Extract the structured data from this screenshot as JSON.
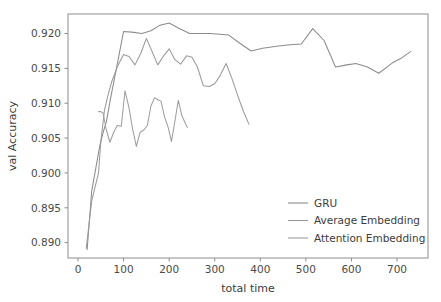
{
  "chart_data": {
    "type": "line",
    "title": "",
    "xlabel": "total time",
    "ylabel": "val Accuracy",
    "xlim": [
      -22,
      768
    ],
    "ylim": [
      0.8878,
      0.9228
    ],
    "grid": false,
    "legend_position": "lower right",
    "xticks": [
      0,
      100,
      200,
      300,
      400,
      500,
      600,
      700
    ],
    "xtick_labels": [
      "0",
      "100",
      "200",
      "300",
      "400",
      "500",
      "600",
      "700"
    ],
    "yticks": [
      0.89,
      0.895,
      0.9,
      0.905,
      0.91,
      0.915,
      0.92
    ],
    "ytick_labels": [
      "0.890",
      "0.895",
      "0.900",
      "0.905",
      "0.910",
      "0.915",
      "0.920"
    ],
    "series": [
      {
        "name": "GRU",
        "color": "#8c8c8c",
        "x": [
          20,
          30,
          48,
          55,
          62,
          72,
          84,
          100,
          118,
          140,
          160,
          180,
          200,
          220,
          245,
          270,
          290,
          310,
          330,
          355,
          380,
          405,
          440,
          465,
          490,
          515,
          540,
          565,
          590,
          610,
          635,
          660,
          690,
          710,
          730
        ],
        "y": [
          0.889,
          0.8974,
          0.904,
          0.9058,
          0.9073,
          0.9109,
          0.9149,
          0.9203,
          0.9202,
          0.92,
          0.9204,
          0.9212,
          0.9215,
          0.9208,
          0.92,
          0.92,
          0.92,
          0.9199,
          0.9198,
          0.9186,
          0.9175,
          0.9179,
          0.9182,
          0.9184,
          0.9185,
          0.9207,
          0.919,
          0.9152,
          0.9155,
          0.9157,
          0.9152,
          0.9143,
          0.9158,
          0.9165,
          0.9174
        ]
      },
      {
        "name": "Average Embedding",
        "color": "#9a9a9a",
        "x": [
          18,
          30,
          45,
          50,
          58,
          66,
          75,
          88,
          100,
          112,
          125,
          138,
          150,
          162,
          175,
          188,
          200,
          212,
          225,
          238,
          250,
          262,
          275,
          288,
          300,
          312,
          325,
          338,
          350,
          362,
          375
        ],
        "y": [
          0.8892,
          0.896,
          0.9,
          0.9045,
          0.909,
          0.9112,
          0.9133,
          0.9155,
          0.917,
          0.9167,
          0.9155,
          0.9172,
          0.9193,
          0.9175,
          0.9155,
          0.9168,
          0.9178,
          0.9163,
          0.9156,
          0.9168,
          0.9166,
          0.9152,
          0.9125,
          0.9124,
          0.9128,
          0.914,
          0.9157,
          0.9135,
          0.9112,
          0.909,
          0.907
        ]
      },
      {
        "name": "Attention Embedding",
        "color": "#9e9e9e",
        "x": [
          45,
          50,
          55,
          62,
          70,
          78,
          86,
          95,
          103,
          112,
          120,
          128,
          136,
          145,
          152,
          160,
          168,
          175,
          182,
          190,
          198,
          205,
          212,
          220,
          228,
          235,
          240
        ],
        "y": [
          0.9088,
          0.9088,
          0.9086,
          0.9062,
          0.9044,
          0.9058,
          0.9068,
          0.9067,
          0.9118,
          0.9093,
          0.9062,
          0.9038,
          0.9058,
          0.9062,
          0.9068,
          0.9096,
          0.9108,
          0.9105,
          0.9103,
          0.908,
          0.9065,
          0.9045,
          0.9072,
          0.9104,
          0.9082,
          0.9072,
          0.9065
        ]
      }
    ]
  },
  "figure": {
    "background_color": "#ffffff",
    "axes_color": "#8d8d8d",
    "text_color": "#3c3c3c"
  }
}
